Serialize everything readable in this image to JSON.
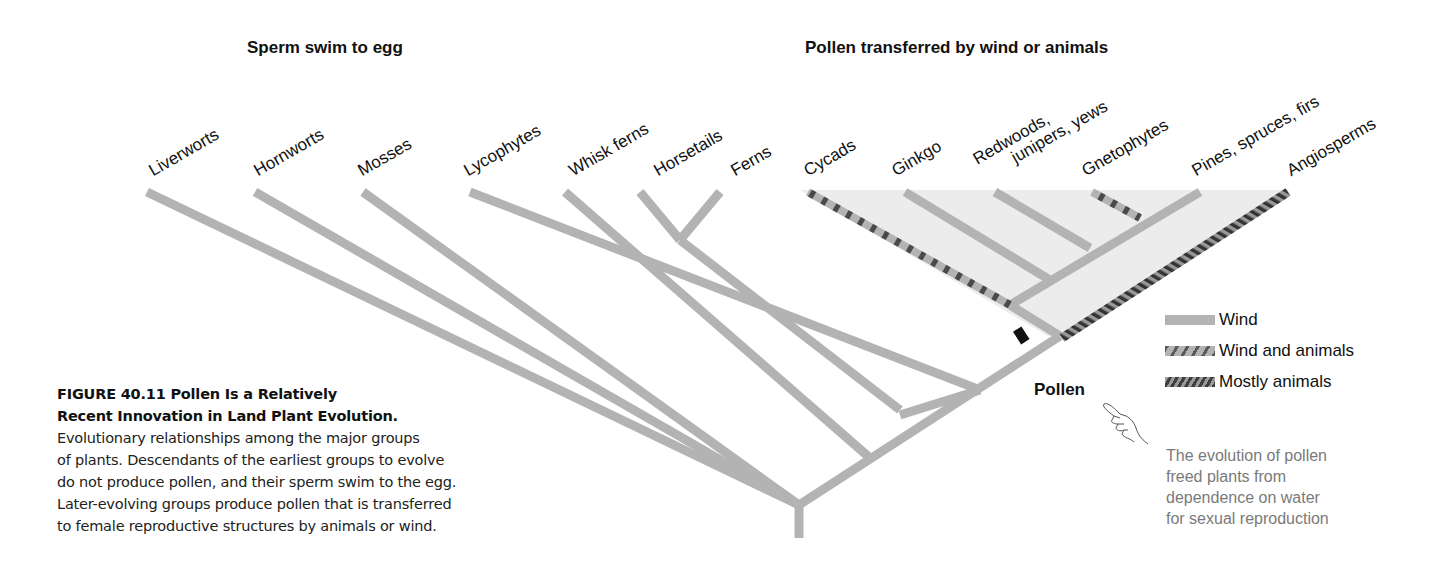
{
  "headers": {
    "left": "Sperm swim to egg",
    "right": "Pollen transferred by wind or animals"
  },
  "taxa": [
    {
      "label": "Liverworts",
      "pollination": "none"
    },
    {
      "label": "Hornworts",
      "pollination": "none"
    },
    {
      "label": "Mosses",
      "pollination": "none"
    },
    {
      "label": "Lycophytes",
      "pollination": "none"
    },
    {
      "label": "Whisk ferns",
      "pollination": "none"
    },
    {
      "label": "Horsetails",
      "pollination": "none"
    },
    {
      "label": "Ferns",
      "pollination": "none"
    },
    {
      "label": "Cycads",
      "pollination": "wind-and-animals"
    },
    {
      "label": "Ginkgo",
      "pollination": "wind"
    },
    {
      "label": "Redwoods,",
      "label2": "junipers, yews",
      "pollination": "wind"
    },
    {
      "label": "Gnetophytes",
      "pollination": "wind-and-animals"
    },
    {
      "label": "Pines, spruces, firs",
      "pollination": "wind"
    },
    {
      "label": "Angiosperms",
      "pollination": "mostly-animals"
    }
  ],
  "legend": {
    "items": [
      {
        "key": "wind",
        "label": "Wind"
      },
      {
        "key": "wind-and-animals",
        "label": "Wind and animals"
      },
      {
        "key": "mostly-animals",
        "label": "Mostly animals"
      }
    ]
  },
  "pollen_marker": {
    "label": "Pollen"
  },
  "annotation": {
    "lines": [
      "The evolution of pollen",
      "freed plants from",
      "dependence on water",
      "for sexual reproduction"
    ]
  },
  "caption": {
    "title_line1": "FIGURE 40.11  Pollen Is a Relatively",
    "title_line2": "Recent Innovation in Land Plant Evolution.",
    "body_lines": [
      "Evolutionary relationships among the major groups",
      "of plants. Descendants of the earliest groups to evolve",
      "do not produce pollen, and their sperm swim to the egg.",
      "Later-evolving groups produce pollen that is transferred",
      "to female reproductive structures by animals or wind."
    ]
  },
  "colors": {
    "branch": "#b3b3b3",
    "shading": "#ececec",
    "stripe_dark": "#3e3e3e",
    "marker": "#111111",
    "annotation_text": "#7a7a7a"
  }
}
